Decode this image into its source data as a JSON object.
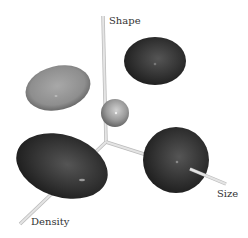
{
  "diagram": {
    "axes": {
      "shape": {
        "label": "Shape"
      },
      "size": {
        "label": "Size"
      },
      "density": {
        "label": "Density"
      }
    },
    "objects": [
      {
        "name": "center-sphere",
        "color": "#9a9a9a"
      },
      {
        "name": "flat-disc-ellipsoid",
        "color": "#8e8e8e"
      },
      {
        "name": "upper-right-ellipsoid",
        "color": "#2e2e2e"
      },
      {
        "name": "elongated-ellipsoid",
        "color": "#333333"
      },
      {
        "name": "round-ellipsoid",
        "color": "#363636"
      }
    ],
    "colors": {
      "axis": "#d8d8d8",
      "background": "#ffffff"
    }
  }
}
